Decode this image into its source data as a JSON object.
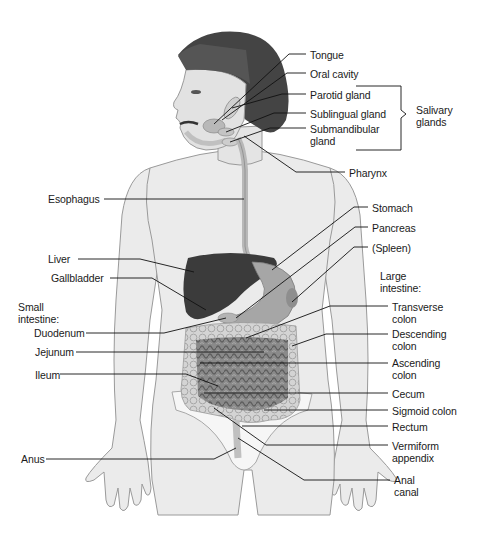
{
  "diagram": {
    "colors": {
      "skin": "#e9e9e9",
      "skin_shade": "#cfcfcf",
      "outline": "#8a8a8a",
      "hair": "#3e3e3e",
      "liver": "#3a3a3a",
      "organ": "#a9a9a9",
      "intestine": "#7a7a7a",
      "colon": "#d6d6d6",
      "leader": "#111111",
      "text": "#1a1a1a"
    },
    "labels_right": [
      {
        "id": "tongue",
        "text": "Tongue",
        "x": 310,
        "y": 49
      },
      {
        "id": "oral-cavity",
        "text": "Oral cavity",
        "x": 310,
        "y": 68
      },
      {
        "id": "parotid-gland",
        "text": "Parotid gland",
        "x": 310,
        "y": 90
      },
      {
        "id": "sublingual-gland",
        "text": "Sublingual gland",
        "x": 310,
        "y": 109
      },
      {
        "id": "submandibular-gland",
        "text": "Submandibular\ngland",
        "x": 310,
        "y": 124
      },
      {
        "id": "pharynx",
        "text": "Pharynx",
        "x": 349,
        "y": 168
      },
      {
        "id": "stomach",
        "text": "Stomach",
        "x": 372,
        "y": 203
      },
      {
        "id": "pancreas",
        "text": "Pancreas",
        "x": 372,
        "y": 223
      },
      {
        "id": "spleen",
        "text": "(Spleen)",
        "x": 372,
        "y": 243
      },
      {
        "id": "transverse-colon",
        "text": "Transverse\ncolon",
        "x": 392,
        "y": 302
      },
      {
        "id": "descending-colon",
        "text": "Descending\ncolon",
        "x": 392,
        "y": 329
      },
      {
        "id": "ascending-colon",
        "text": "Ascending\ncolon",
        "x": 392,
        "y": 359
      },
      {
        "id": "cecum",
        "text": "Cecum",
        "x": 392,
        "y": 389
      },
      {
        "id": "sigmoid-colon",
        "text": "Sigmoid colon",
        "x": 392,
        "y": 406
      },
      {
        "id": "rectum",
        "text": "Rectum",
        "x": 392,
        "y": 422
      },
      {
        "id": "vermiform-appendix",
        "text": "Vermiform\nappendix",
        "x": 392,
        "y": 441
      },
      {
        "id": "anal-canal",
        "text": "Anal\ncanal",
        "x": 394,
        "y": 475
      }
    ],
    "labels_left": [
      {
        "id": "esophagus",
        "text": "Esophagus",
        "x": 48,
        "y": 194
      },
      {
        "id": "liver",
        "text": "Liver",
        "x": 48,
        "y": 254
      },
      {
        "id": "gallbladder",
        "text": "Gallbladder",
        "x": 51,
        "y": 273
      },
      {
        "id": "duodenum",
        "text": "Duodenum",
        "x": 34,
        "y": 328
      },
      {
        "id": "jejunum",
        "text": "Jejunum",
        "x": 35,
        "y": 347
      },
      {
        "id": "ileum",
        "text": "Ileum",
        "x": 35,
        "y": 370
      },
      {
        "id": "anus",
        "text": "Anus",
        "x": 21,
        "y": 454
      }
    ],
    "group_labels": [
      {
        "id": "salivary-glands",
        "text": "Salivary\nglands",
        "x": 416,
        "y": 110
      },
      {
        "id": "large-intestine",
        "text": "Large\nintestine:",
        "x": 380,
        "y": 271
      },
      {
        "id": "small-intestine",
        "text": "Small\nintestine:",
        "x": 18,
        "y": 302
      }
    ]
  }
}
